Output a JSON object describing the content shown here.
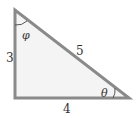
{
  "diagram": {
    "type": "right-triangle",
    "fill_color": "#f4f4f4",
    "stroke_color": "#8a8a8a",
    "sides": {
      "vertical": "3",
      "hypotenuse": "5",
      "horizontal": "4"
    },
    "angles": {
      "top": "φ",
      "bottom_right": "θ"
    }
  }
}
